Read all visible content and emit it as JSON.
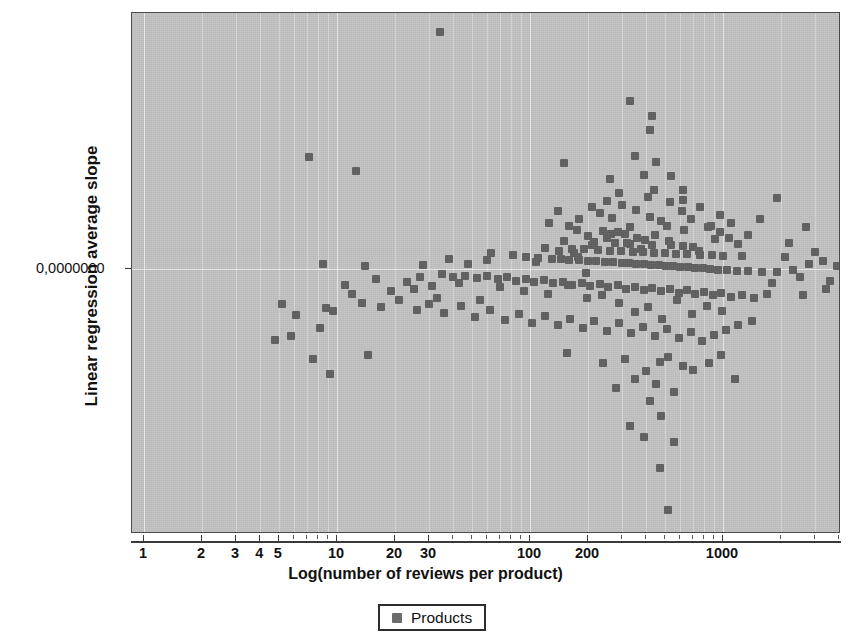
{
  "chart_data": {
    "type": "scatter",
    "title": "",
    "xlabel": "Log(number of reviews per product)",
    "ylabel": "Linear regression average slope",
    "xscale": "log",
    "yscale": "linear",
    "grid": true,
    "legend_position": "bottom-center",
    "xlim": [
      1,
      5000
    ],
    "ylim": [
      -1.0,
      1.0
    ],
    "xtick_labels": [
      "1",
      "2",
      "3",
      "4",
      "5",
      "10",
      "20",
      "30",
      "100",
      "200",
      "1000"
    ],
    "xtick_values": [
      1,
      2,
      3,
      4,
      5,
      10,
      20,
      30,
      100,
      200,
      1000
    ],
    "ytick_labels": [
      "0,0000000"
    ],
    "ytick_values": [
      0
    ],
    "series": [
      {
        "name": "Products",
        "marker": "square",
        "color": "#5f5f5f",
        "points": [
          [
            34,
            0.905
          ],
          [
            330,
            0.64
          ],
          [
            430,
            0.585
          ],
          [
            420,
            0.53
          ],
          [
            7.2,
            0.427
          ],
          [
            12.5,
            0.375
          ],
          [
            150,
            0.405
          ],
          [
            260,
            0.345
          ],
          [
            390,
            0.36
          ],
          [
            440,
            0.3
          ],
          [
            620,
            0.3
          ],
          [
            1900,
            0.27
          ],
          [
            300,
            0.245
          ],
          [
            355,
            0.225
          ],
          [
            230,
            0.215
          ],
          [
            420,
            0.2
          ],
          [
            265,
            0.195
          ],
          [
            480,
            0.185
          ],
          [
            510,
            0.165
          ],
          [
            330,
            0.16
          ],
          [
            175,
            0.15
          ],
          [
            240,
            0.145
          ],
          [
            285,
            0.14
          ],
          [
            310,
            0.135
          ],
          [
            200,
            0.125
          ],
          [
            250,
            0.12
          ],
          [
            360,
            0.118
          ],
          [
            395,
            0.112
          ],
          [
            150,
            0.105
          ],
          [
            215,
            0.102
          ],
          [
            275,
            0.098
          ],
          [
            330,
            0.095
          ],
          [
            430,
            0.092
          ],
          [
            540,
            0.09
          ],
          [
            620,
            0.088
          ],
          [
            700,
            0.085
          ],
          [
            120,
            0.08
          ],
          [
            165,
            0.078
          ],
          [
            190,
            0.075
          ],
          [
            225,
            0.073
          ],
          [
            260,
            0.07
          ],
          [
            295,
            0.068
          ],
          [
            340,
            0.066
          ],
          [
            385,
            0.064
          ],
          [
            440,
            0.062
          ],
          [
            500,
            0.06
          ],
          [
            570,
            0.058
          ],
          [
            650,
            0.056
          ],
          [
            760,
            0.054
          ],
          [
            880,
            0.052
          ],
          [
            1000,
            0.05
          ],
          [
            1250,
            0.05
          ],
          [
            8.5,
            0.02
          ],
          [
            14,
            0.01
          ],
          [
            95,
            0.045
          ],
          [
            110,
            0.042
          ],
          [
            130,
            0.04
          ],
          [
            145,
            0.038
          ],
          [
            160,
            0.036
          ],
          [
            180,
            0.034
          ],
          [
            200,
            0.032
          ],
          [
            220,
            0.03
          ],
          [
            245,
            0.028
          ],
          [
            270,
            0.026
          ],
          [
            300,
            0.024
          ],
          [
            325,
            0.022
          ],
          [
            355,
            0.02
          ],
          [
            390,
            0.018
          ],
          [
            425,
            0.016
          ],
          [
            465,
            0.014
          ],
          [
            505,
            0.012
          ],
          [
            550,
            0.01
          ],
          [
            600,
            0.008
          ],
          [
            660,
            0.006
          ],
          [
            720,
            0.004
          ],
          [
            790,
            0.002
          ],
          [
            860,
            0.0
          ],
          [
            940,
            -0.002
          ],
          [
            1050,
            -0.004
          ],
          [
            1180,
            -0.006
          ],
          [
            1350,
            -0.008
          ],
          [
            1600,
            -0.01
          ],
          [
            1900,
            -0.012
          ],
          [
            2300,
            -0.005
          ],
          [
            2800,
            0.02
          ],
          [
            3300,
            0.03
          ],
          [
            3900,
            0.01
          ],
          [
            4400,
            -0.01
          ],
          [
            40,
            -0.03
          ],
          [
            46,
            -0.025
          ],
          [
            53,
            -0.035
          ],
          [
            60,
            -0.028
          ],
          [
            68,
            -0.04
          ],
          [
            76,
            -0.032
          ],
          [
            85,
            -0.045
          ],
          [
            95,
            -0.038
          ],
          [
            105,
            -0.05
          ],
          [
            118,
            -0.042
          ],
          [
            132,
            -0.055
          ],
          [
            148,
            -0.048
          ],
          [
            165,
            -0.06
          ],
          [
            185,
            -0.052
          ],
          [
            205,
            -0.065
          ],
          [
            230,
            -0.058
          ],
          [
            255,
            -0.07
          ],
          [
            285,
            -0.062
          ],
          [
            315,
            -0.075
          ],
          [
            350,
            -0.068
          ],
          [
            390,
            -0.08
          ],
          [
            430,
            -0.072
          ],
          [
            480,
            -0.085
          ],
          [
            530,
            -0.078
          ],
          [
            590,
            -0.09
          ],
          [
            650,
            -0.082
          ],
          [
            720,
            -0.095
          ],
          [
            800,
            -0.088
          ],
          [
            890,
            -0.1
          ],
          [
            980,
            -0.092
          ],
          [
            1100,
            -0.105
          ],
          [
            1250,
            -0.098
          ],
          [
            1450,
            -0.11
          ],
          [
            1700,
            -0.095
          ],
          [
            5.2,
            -0.135
          ],
          [
            6.1,
            -0.175
          ],
          [
            8.8,
            -0.15
          ],
          [
            9.5,
            -0.16
          ],
          [
            13.5,
            -0.128
          ],
          [
            17,
            -0.145
          ],
          [
            21,
            -0.12
          ],
          [
            26,
            -0.155
          ],
          [
            30,
            -0.132
          ],
          [
            36,
            -0.168
          ],
          [
            44,
            -0.142
          ],
          [
            52,
            -0.185
          ],
          [
            62,
            -0.158
          ],
          [
            74,
            -0.196
          ],
          [
            88,
            -0.172
          ],
          [
            102,
            -0.205
          ],
          [
            120,
            -0.18
          ],
          [
            140,
            -0.215
          ],
          [
            162,
            -0.19
          ],
          [
            188,
            -0.225
          ],
          [
            215,
            -0.2
          ],
          [
            250,
            -0.235
          ],
          [
            290,
            -0.208
          ],
          [
            335,
            -0.245
          ],
          [
            385,
            -0.22
          ],
          [
            445,
            -0.255
          ],
          [
            510,
            -0.23
          ],
          [
            590,
            -0.265
          ],
          [
            680,
            -0.24
          ],
          [
            780,
            -0.275
          ],
          [
            900,
            -0.25
          ],
          [
            1040,
            -0.232
          ],
          [
            1200,
            -0.215
          ],
          [
            1420,
            -0.198
          ],
          [
            7.5,
            -0.345
          ],
          [
            9.2,
            -0.4
          ],
          [
            14.5,
            -0.33
          ],
          [
            155,
            -0.32
          ],
          [
            240,
            -0.36
          ],
          [
            310,
            -0.345
          ],
          [
            400,
            -0.39
          ],
          [
            470,
            -0.355
          ],
          [
            350,
            -0.42
          ],
          [
            520,
            -0.335
          ],
          [
            620,
            -0.37
          ],
          [
            280,
            -0.455
          ],
          [
            450,
            -0.44
          ],
          [
            560,
            -0.47
          ],
          [
            420,
            -0.505
          ],
          [
            700,
            -0.385
          ],
          [
            850,
            -0.36
          ],
          [
            980,
            -0.33
          ],
          [
            1150,
            -0.42
          ],
          [
            330,
            -0.6
          ],
          [
            480,
            -0.56
          ],
          [
            390,
            -0.64
          ],
          [
            560,
            -0.66
          ],
          [
            470,
            -0.76
          ],
          [
            520,
            -0.92
          ],
          [
            170,
            0.06
          ],
          [
            195,
            -0.015
          ],
          [
            210,
            0.09
          ],
          [
            235,
            -0.1
          ],
          [
            262,
            0.135
          ],
          [
            288,
            -0.13
          ],
          [
            318,
            0.1
          ],
          [
            348,
            -0.165
          ],
          [
            378,
            0.075
          ],
          [
            410,
            -0.145
          ],
          [
            445,
            0.13
          ],
          [
            485,
            -0.19
          ],
          [
            525,
            0.105
          ],
          [
            575,
            -0.12
          ],
          [
            630,
            0.15
          ],
          [
            690,
            -0.17
          ],
          [
            755,
            0.07
          ],
          [
            825,
            -0.14
          ],
          [
            905,
            0.115
          ],
          [
            990,
            -0.16
          ],
          [
            60,
            0.035
          ],
          [
            70,
            -0.07
          ],
          [
            82,
            0.055
          ],
          [
            93,
            -0.085
          ],
          [
            108,
            0.025
          ],
          [
            124,
            -0.095
          ],
          [
            142,
            0.07
          ],
          [
            158,
            -0.06
          ],
          [
            178,
            0.045
          ],
          [
            198,
            -0.11
          ],
          [
            2100,
            0.045
          ],
          [
            2500,
            -0.03
          ],
          [
            3000,
            0.065
          ],
          [
            3600,
            -0.045
          ],
          [
            4200,
            0.035
          ],
          [
            4800,
            0.055
          ],
          [
            2700,
            0.16
          ],
          [
            3400,
            -0.075
          ],
          [
            1550,
            0.19
          ],
          [
            1800,
            -0.055
          ],
          [
            2200,
            0.1
          ],
          [
            2600,
            -0.1
          ],
          [
            1350,
            0.13
          ],
          [
            1100,
            0.175
          ],
          [
            960,
            0.205
          ],
          [
            840,
            0.16
          ],
          [
            25,
            -0.075
          ],
          [
            28,
            0.015
          ],
          [
            33,
            -0.11
          ],
          [
            38,
            0.04
          ],
          [
            43,
            -0.055
          ],
          [
            48,
            0.02
          ],
          [
            55,
            -0.12
          ],
          [
            63,
            0.06
          ],
          [
            4.8,
            -0.27
          ],
          [
            5.8,
            -0.255
          ],
          [
            8.2,
            -0.225
          ],
          [
            11,
            -0.06
          ],
          [
            12,
            -0.095
          ],
          [
            16,
            -0.04
          ],
          [
            19,
            -0.085
          ],
          [
            23,
            -0.05
          ],
          [
            27,
            -0.03
          ],
          [
            31,
            -0.065
          ],
          [
            35,
            -0.02
          ],
          [
            530,
            0.255
          ],
          [
            610,
            0.22
          ],
          [
            680,
            0.19
          ],
          [
            760,
            0.235
          ],
          [
            870,
            0.165
          ],
          [
            960,
            0.14
          ],
          [
            1080,
            0.12
          ],
          [
            1200,
            0.095
          ],
          [
            450,
            0.41
          ],
          [
            540,
            0.355
          ],
          [
            620,
            0.265
          ],
          [
            350,
            0.43
          ],
          [
            410,
            0.275
          ],
          [
            290,
            0.29
          ],
          [
            250,
            0.26
          ],
          [
            210,
            0.235
          ],
          [
            180,
            0.19
          ],
          [
            160,
            0.165
          ],
          [
            140,
            0.22
          ],
          [
            125,
            0.175
          ]
        ]
      }
    ]
  },
  "axes": {
    "y_title": "Linear regression average slope",
    "x_title": "Log(number of reviews per product)",
    "y_tick_label": "0,0000000"
  },
  "legend": {
    "label": "Products",
    "swatch_color": "#6c6c6c"
  },
  "colors": {
    "plot_background": "#c2c2c2",
    "marker": "#5f5f5f",
    "gridline": "#ffffff",
    "axis": "#3a3a3a",
    "text": "#111111"
  }
}
